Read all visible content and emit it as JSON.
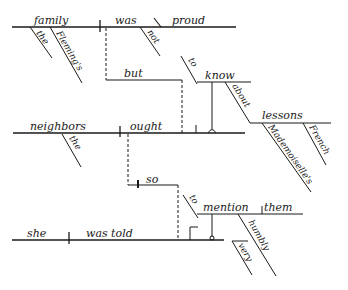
{
  "diagram": {
    "type": "Reed-Kellogg sentence diagram",
    "clause1": {
      "subject": "family",
      "subject_modifiers": [
        "the",
        "Fleming's"
      ],
      "verb": "was",
      "verb_modifiers": [
        "not"
      ],
      "predicate_adjective": "proud"
    },
    "conjunction_1": "but",
    "infinitive_1": {
      "to": "to",
      "verb": "know",
      "preposition": "about",
      "object": "lessons",
      "object_modifiers": [
        "Mademoiselle's",
        "French"
      ]
    },
    "clause2": {
      "subject": "neighbors",
      "subject_modifiers": [
        "the"
      ],
      "verb": "ought"
    },
    "conjunction_2": "so",
    "infinitive_2": {
      "to": "to",
      "verb": "mention",
      "object": "them",
      "verb_modifiers": [
        "humbly"
      ],
      "modifier_of_modifier": "very"
    },
    "clause3": {
      "subject": "she",
      "verb": "was told"
    }
  }
}
